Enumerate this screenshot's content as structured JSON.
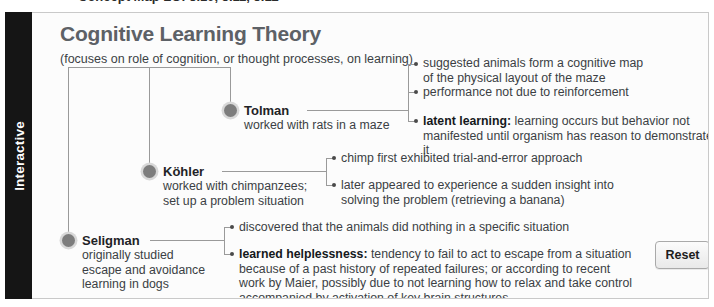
{
  "clipped_header": {
    "text": "Concept Map LO: 5.10, 5.11, 5.12"
  },
  "side_tab": {
    "label": "Interactive"
  },
  "header": {
    "title": "Cognitive Learning Theory",
    "subtitle": "(focuses on role of cognition, or thought processes, on learning)"
  },
  "nodes": [
    {
      "name": "Tolman",
      "description": "worked with rats in a maze",
      "bullets": [
        {
          "bold": "",
          "text": "suggested animals form a cognitive map\nof the physical layout of the maze"
        },
        {
          "bold": "",
          "text": "performance not due to reinforcement"
        },
        {
          "bold": "latent learning:",
          "text": " learning occurs but behavior not\nmanifested until organism has reason to demonstrate it"
        }
      ]
    },
    {
      "name": "Köhler",
      "description": "worked with chimpanzees;\nset up a problem situation",
      "bullets": [
        {
          "bold": "",
          "text": "chimp first exhibited trial-and-error approach"
        },
        {
          "bold": "",
          "text": "later appeared to experience a sudden insight into\nsolving the problem (retrieving a banana)"
        }
      ]
    },
    {
      "name": "Seligman",
      "description": "originally studied\nescape and avoidance\nlearning in dogs",
      "bullets": [
        {
          "bold": "",
          "text": "discovered that the animals did nothing in a specific situation"
        },
        {
          "bold": "learned helplessness:",
          "text": " tendency to fail to act to escape from a situation\nbecause of a past history of repeated failures; or according to recent\nwork by Maier, possibly due to not learning how to relax and take control\naccompanied by activation of key brain structures"
        }
      ]
    }
  ],
  "controls": {
    "reset_label": "Reset"
  },
  "colors": {
    "tab_background": "#151515",
    "panel_background": "#fcfcfc",
    "panel_border": "#c9c9c9",
    "title_color": "#5d6166",
    "body_text": "#3b3f44",
    "connector": "#9a9a9a",
    "node_dot": "#7d7d7d"
  }
}
